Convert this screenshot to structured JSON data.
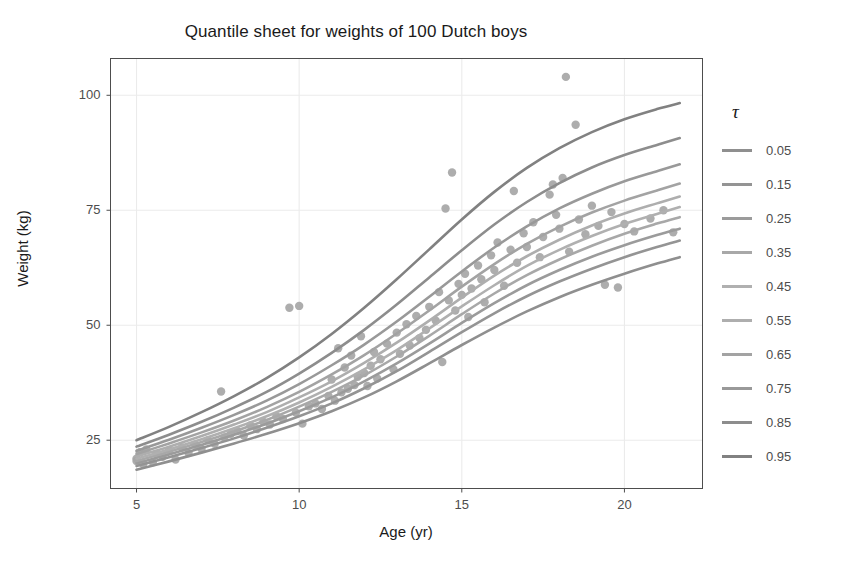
{
  "chart_data": {
    "type": "line",
    "title": "Quantile sheet for weights of 100 Dutch boys",
    "xlabel": "Age (yr)",
    "ylabel": "Weight (kg)",
    "xlim": [
      4.2,
      22.4
    ],
    "ylim": [
      14.5,
      108.0
    ],
    "xticks": [
      5,
      10,
      15,
      20
    ],
    "xticklabels": [
      "5",
      "10",
      "15",
      "20"
    ],
    "yticks": [
      25,
      50,
      75,
      100
    ],
    "yticklabels": [
      "25",
      "50",
      "75",
      "100"
    ],
    "grid": true,
    "grid_color": "#ebebeb",
    "legend_position": "right",
    "legend_title": "τ",
    "panel_border_color": "#4d4d4d",
    "point_color": "#a6a6a6",
    "point_size": 4.2,
    "line_width": 2.6,
    "x": [
      5.0,
      6.0,
      7.0,
      8.0,
      9.0,
      10.0,
      11.0,
      12.0,
      13.0,
      14.0,
      15.0,
      16.0,
      17.0,
      18.0,
      19.0,
      20.0,
      21.0,
      21.7
    ],
    "series": [
      {
        "name": "0.05",
        "tau": 0.05,
        "color": "#8f8f8f",
        "values": [
          18.6,
          20.4,
          22.3,
          24.3,
          26.4,
          28.7,
          31.3,
          34.3,
          37.8,
          41.7,
          45.7,
          49.5,
          53.0,
          56.1,
          58.8,
          61.2,
          63.4,
          64.8
        ]
      },
      {
        "name": "0.15",
        "tau": 0.15,
        "color": "#949494",
        "values": [
          19.4,
          21.3,
          23.3,
          25.4,
          27.7,
          30.2,
          33.0,
          36.3,
          40.0,
          44.2,
          48.5,
          52.6,
          56.3,
          59.5,
          62.3,
          64.8,
          67.0,
          68.4
        ]
      },
      {
        "name": "0.25",
        "tau": 0.25,
        "color": "#9b9b9b",
        "values": [
          20.0,
          21.9,
          24.0,
          26.2,
          28.6,
          31.3,
          34.3,
          37.8,
          41.7,
          46.0,
          50.5,
          54.8,
          58.7,
          62.0,
          64.9,
          67.4,
          69.6,
          71.0
        ]
      },
      {
        "name": "0.35",
        "tau": 0.35,
        "color": "#a8a8a8",
        "values": [
          20.5,
          22.5,
          24.6,
          26.9,
          29.4,
          32.3,
          35.5,
          39.1,
          43.2,
          47.7,
          52.4,
          56.9,
          60.9,
          64.3,
          67.3,
          69.9,
          72.1,
          73.5
        ]
      },
      {
        "name": "0.45",
        "tau": 0.45,
        "color": "#b0b0b0",
        "values": [
          21.0,
          23.0,
          25.2,
          27.6,
          30.2,
          33.2,
          36.6,
          40.4,
          44.6,
          49.3,
          54.1,
          58.7,
          62.9,
          66.4,
          69.4,
          72.0,
          74.2,
          75.7
        ]
      },
      {
        "name": "0.55",
        "tau": 0.55,
        "color": "#aeaeae",
        "values": [
          21.5,
          23.6,
          25.9,
          28.4,
          31.1,
          34.3,
          37.8,
          41.8,
          46.2,
          51.0,
          56.0,
          60.8,
          65.0,
          68.6,
          71.7,
          74.3,
          76.5,
          78.0
        ]
      },
      {
        "name": "0.65",
        "tau": 0.65,
        "color": "#a3a3a3",
        "values": [
          22.0,
          24.3,
          26.7,
          29.3,
          32.2,
          35.5,
          39.3,
          43.5,
          48.2,
          53.2,
          58.4,
          63.3,
          67.7,
          71.4,
          74.5,
          77.1,
          79.3,
          80.8
        ]
      },
      {
        "name": "0.75",
        "tau": 0.75,
        "color": "#999999",
        "values": [
          22.7,
          25.1,
          27.7,
          30.5,
          33.6,
          37.2,
          41.3,
          45.8,
          50.8,
          56.2,
          61.7,
          66.9,
          71.5,
          75.4,
          78.6,
          81.3,
          83.5,
          85.0
        ]
      },
      {
        "name": "0.85",
        "tau": 0.85,
        "color": "#8d8d8d",
        "values": [
          23.6,
          26.2,
          29.0,
          32.1,
          35.5,
          39.5,
          44.0,
          49.0,
          54.5,
          60.4,
          66.3,
          71.9,
          76.8,
          80.9,
          84.3,
          87.0,
          89.2,
          90.7
        ]
      },
      {
        "name": "0.95",
        "tau": 0.95,
        "color": "#818181",
        "values": [
          25.0,
          27.9,
          31.1,
          34.6,
          38.5,
          43.0,
          48.1,
          53.8,
          60.0,
          66.5,
          73.0,
          79.0,
          84.2,
          88.5,
          92.0,
          94.8,
          97.0,
          98.3
        ]
      }
    ],
    "scatter_points": [
      [
        5.0,
        21.0
      ],
      [
        5.0,
        20.5
      ],
      [
        5.1,
        22.4
      ],
      [
        5.2,
        19.8
      ],
      [
        5.3,
        23.0
      ],
      [
        5.5,
        20.2
      ],
      [
        5.6,
        22.0
      ],
      [
        5.8,
        21.4
      ],
      [
        6.0,
        22.8
      ],
      [
        6.2,
        20.8
      ],
      [
        6.4,
        23.4
      ],
      [
        6.6,
        22.2
      ],
      [
        6.8,
        24.0
      ],
      [
        7.0,
        23.1
      ],
      [
        7.2,
        25.0
      ],
      [
        7.4,
        24.2
      ],
      [
        7.6,
        35.6
      ],
      [
        7.7,
        25.6
      ],
      [
        7.9,
        26.4
      ],
      [
        8.1,
        27.0
      ],
      [
        8.3,
        26.0
      ],
      [
        8.5,
        28.2
      ],
      [
        8.7,
        27.4
      ],
      [
        8.9,
        29.0
      ],
      [
        9.1,
        28.4
      ],
      [
        9.3,
        30.2
      ],
      [
        9.5,
        29.6
      ],
      [
        9.7,
        53.8
      ],
      [
        9.9,
        31.0
      ],
      [
        10.0,
        54.2
      ],
      [
        10.1,
        28.6
      ],
      [
        10.3,
        32.4
      ],
      [
        10.5,
        33.0
      ],
      [
        10.7,
        31.8
      ],
      [
        10.9,
        34.6
      ],
      [
        11.0,
        38.2
      ],
      [
        11.1,
        33.6
      ],
      [
        11.2,
        45.0
      ],
      [
        11.3,
        35.4
      ],
      [
        11.4,
        40.8
      ],
      [
        11.5,
        36.2
      ],
      [
        11.6,
        43.4
      ],
      [
        11.7,
        37.0
      ],
      [
        11.8,
        38.8
      ],
      [
        11.9,
        47.6
      ],
      [
        12.0,
        39.6
      ],
      [
        12.1,
        36.8
      ],
      [
        12.2,
        41.2
      ],
      [
        12.3,
        44.2
      ],
      [
        12.4,
        38.4
      ],
      [
        12.5,
        42.6
      ],
      [
        12.7,
        46.0
      ],
      [
        12.9,
        40.4
      ],
      [
        13.0,
        48.4
      ],
      [
        13.1,
        43.8
      ],
      [
        13.3,
        50.2
      ],
      [
        13.4,
        45.6
      ],
      [
        13.6,
        52.0
      ],
      [
        13.7,
        47.2
      ],
      [
        13.9,
        49.0
      ],
      [
        14.0,
        54.0
      ],
      [
        14.2,
        51.0
      ],
      [
        14.3,
        57.2
      ],
      [
        14.4,
        42.0
      ],
      [
        14.5,
        75.4
      ],
      [
        14.6,
        55.4
      ],
      [
        14.7,
        83.2
      ],
      [
        14.8,
        53.2
      ],
      [
        14.9,
        59.0
      ],
      [
        15.0,
        56.6
      ],
      [
        15.1,
        61.2
      ],
      [
        15.2,
        51.8
      ],
      [
        15.3,
        58.0
      ],
      [
        15.5,
        63.0
      ],
      [
        15.6,
        60.0
      ],
      [
        15.7,
        55.0
      ],
      [
        15.9,
        65.2
      ],
      [
        16.0,
        62.0
      ],
      [
        16.1,
        68.0
      ],
      [
        16.3,
        58.6
      ],
      [
        16.5,
        66.4
      ],
      [
        16.6,
        79.2
      ],
      [
        16.7,
        63.6
      ],
      [
        16.9,
        70.0
      ],
      [
        17.0,
        67.0
      ],
      [
        17.2,
        72.4
      ],
      [
        17.4,
        64.8
      ],
      [
        17.5,
        69.2
      ],
      [
        17.7,
        78.4
      ],
      [
        17.8,
        80.6
      ],
      [
        17.9,
        74.0
      ],
      [
        18.0,
        71.0
      ],
      [
        18.1,
        82.0
      ],
      [
        18.2,
        104.0
      ],
      [
        18.3,
        66.0
      ],
      [
        18.5,
        93.6
      ],
      [
        18.6,
        73.0
      ],
      [
        18.8,
        69.8
      ],
      [
        19.0,
        76.0
      ],
      [
        19.2,
        71.6
      ],
      [
        19.4,
        58.8
      ],
      [
        19.6,
        74.6
      ],
      [
        19.8,
        58.2
      ],
      [
        20.0,
        72.0
      ],
      [
        20.3,
        70.4
      ],
      [
        20.8,
        73.2
      ],
      [
        21.2,
        75.0
      ],
      [
        21.5,
        70.2
      ]
    ]
  },
  "legend": {
    "title": "τ",
    "entries": [
      {
        "label": "0.05"
      },
      {
        "label": "0.15"
      },
      {
        "label": "0.25"
      },
      {
        "label": "0.35"
      },
      {
        "label": "0.45"
      },
      {
        "label": "0.55"
      },
      {
        "label": "0.65"
      },
      {
        "label": "0.75"
      },
      {
        "label": "0.85"
      },
      {
        "label": "0.95"
      }
    ]
  }
}
